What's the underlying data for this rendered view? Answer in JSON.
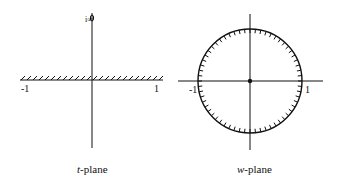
{
  "figure": {
    "t_plane": {
      "caption_var": "t",
      "caption_rest": "-plane",
      "top_label": "i∞",
      "tick_left": "-1",
      "tick_right": "1"
    },
    "w_plane": {
      "caption_var": "w",
      "caption_rest": "-plane",
      "tick_left": "-1",
      "tick_right": "1"
    },
    "colors": {
      "ink": "#111111",
      "background": "#ffffff"
    }
  }
}
